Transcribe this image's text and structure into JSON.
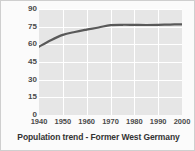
{
  "chart_data": {
    "type": "line",
    "title": "Population trend - Former West Germany",
    "xlabel": "",
    "ylabel": "Population (millions)",
    "x": [
      1940,
      1950,
      1960,
      1970,
      1980,
      1990,
      2000
    ],
    "xticklabels": [
      "1940",
      "1950",
      "1960",
      "1970",
      "1980",
      "1990",
      "2000"
    ],
    "xlim": [
      1940,
      2000
    ],
    "yticks": [
      0,
      15,
      30,
      45,
      60,
      75,
      90
    ],
    "yticklabels": [
      "0",
      "15",
      "30",
      "45",
      "60",
      "75",
      "90"
    ],
    "ylim": [
      0,
      90
    ],
    "grid": true,
    "legend": false,
    "series": [
      {
        "name": "Population",
        "values": [
          58,
          68,
          72.5,
          76.5,
          76.5,
          76.5,
          77
        ],
        "color": "#595959"
      }
    ],
    "dense_points": {
      "x": [
        1940,
        1945,
        1950,
        1955,
        1960,
        1965,
        1970,
        1975,
        1980,
        1985,
        1990,
        1995,
        2000
      ],
      "y": [
        58,
        63.5,
        68,
        70.5,
        72.5,
        74.3,
        76.3,
        76.6,
        76.5,
        76.4,
        76.5,
        76.8,
        77
      ]
    }
  },
  "style": {
    "plot_background": "#e6e6e6",
    "grid_color": "#ffffff",
    "line_color": "#595959",
    "text_color": "#4a4a4a",
    "title_color": "#333333",
    "figure_background": "#fbfbfb",
    "border_color": "#cfcfcf"
  }
}
